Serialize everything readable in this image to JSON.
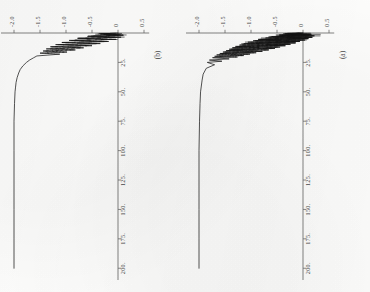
{
  "figure": {
    "orientation_note": "rotated-90-clockwise",
    "background_color": "#fdfdfc",
    "ink_color": "#1a1a1a",
    "axis_color": "#6b6b6b"
  },
  "panels": [
    {
      "id": "a",
      "caption": "(a)",
      "position": "right"
    },
    {
      "id": "b",
      "caption": "(b)",
      "position": "left"
    }
  ],
  "chart_data": [
    {
      "type": "line",
      "panel": "a",
      "title": "(a)",
      "xlabel": "",
      "ylabel": "",
      "xlim": [
        0,
        210
      ],
      "ylim": [
        -2.25,
        0.6
      ],
      "grid": false,
      "legend": null,
      "xticks": [
        25,
        50,
        75,
        100,
        125,
        150,
        175,
        200
      ],
      "xticklabels": [
        "25.",
        "50.",
        "75.",
        "100.",
        "125.",
        "150.",
        "175.",
        "200."
      ],
      "yticks": [
        -2.0,
        -1.5,
        -1.0,
        -0.5,
        0,
        0.5
      ],
      "yticklabels": [
        "-2.0",
        "-1.5",
        "-1.0",
        "-0.5",
        "0",
        "0.5"
      ],
      "description": "Strongly damped high-frequency oscillation starting near 0, large dense oscillation band within t<20, decaying to a flat plateau near -2.0 held out to t=200.",
      "plateau_value": -2.0,
      "x": [
        0,
        0.6,
        1.2,
        1.8,
        2.4,
        3.0,
        3.6,
        4.2,
        4.8,
        5.4,
        6.0,
        6.6,
        7.2,
        7.8,
        8.4,
        9.0,
        9.6,
        10.2,
        10.8,
        11.4,
        12.0,
        12.6,
        13.2,
        13.8,
        14.4,
        15.0,
        15.6,
        16.2,
        16.8,
        17.4,
        18.0,
        18.6,
        19.2,
        19.8,
        20.4,
        21.0,
        22.0,
        23.0,
        24.0,
        25.0,
        27.0,
        30.0,
        35.0,
        40.0,
        50.0,
        60.0,
        75.0,
        100.0,
        125.0,
        150.0,
        175.0,
        200.0
      ],
      "y": [
        0.0,
        -0.28,
        0.16,
        -0.46,
        0.22,
        -0.6,
        0.18,
        -0.72,
        0.1,
        -0.86,
        0.04,
        -0.96,
        -0.06,
        -1.06,
        -0.14,
        -1.14,
        -0.24,
        -1.22,
        -0.34,
        -1.3,
        -0.44,
        -1.36,
        -0.54,
        -1.42,
        -0.66,
        -1.48,
        -0.78,
        -1.54,
        -0.9,
        -1.6,
        -1.02,
        -1.66,
        -1.14,
        -1.7,
        -1.26,
        -1.74,
        -1.42,
        -1.8,
        -1.56,
        -1.84,
        -1.7,
        -1.86,
        -1.92,
        -1.94,
        -1.97,
        -1.98,
        -1.99,
        -2.0,
        -2.0,
        -2.0,
        -2.0,
        -2.0
      ]
    },
    {
      "type": "line",
      "panel": "b",
      "title": "(b)",
      "xlabel": "",
      "ylabel": "",
      "xlim": [
        0,
        210
      ],
      "ylim": [
        -2.25,
        0.6
      ],
      "grid": false,
      "legend": null,
      "xticks": [
        25,
        50,
        75,
        100,
        125,
        150,
        175,
        200
      ],
      "xticklabels": [
        "25.",
        "50.",
        "75.",
        "100.",
        "125.",
        "150.",
        "175.",
        "200."
      ],
      "yticks": [
        -2.0,
        -1.5,
        -1.0,
        -0.5,
        0,
        0.5
      ],
      "yticklabels": [
        "-2.0",
        "-1.5",
        "-1.0",
        "-0.5",
        "0",
        "0.5"
      ],
      "description": "Smoother damped oscillation with fewer spikes than panel (a); brief oscillation band within t<18 then a clean monotonic exponential approach to a flat plateau near -2.0 out to t=200.",
      "plateau_value": -2.0,
      "x": [
        0,
        0.9,
        1.8,
        2.7,
        3.6,
        4.5,
        5.4,
        6.3,
        7.2,
        8.1,
        9.0,
        9.9,
        10.8,
        11.7,
        12.6,
        13.5,
        14.4,
        15.3,
        16.2,
        17.1,
        18.0,
        19.5,
        21.0,
        23.0,
        25.0,
        28.0,
        31.0,
        34.0,
        38.0,
        42.0,
        46.0,
        50.0,
        60.0,
        75.0,
        100.0,
        125.0,
        150.0,
        175.0,
        200.0
      ],
      "y": [
        0.0,
        -0.34,
        0.1,
        -0.58,
        0.06,
        -0.78,
        -0.04,
        -0.94,
        -0.18,
        -1.08,
        -0.34,
        -1.2,
        -0.5,
        -1.3,
        -0.66,
        -1.38,
        -0.82,
        -1.44,
        -0.98,
        -1.5,
        -1.12,
        -1.56,
        -1.62,
        -1.7,
        -1.76,
        -1.83,
        -1.88,
        -1.91,
        -1.94,
        -1.96,
        -1.97,
        -1.98,
        -1.99,
        -2.0,
        -2.0,
        -2.0,
        -2.0,
        -2.0,
        -2.0
      ]
    }
  ]
}
